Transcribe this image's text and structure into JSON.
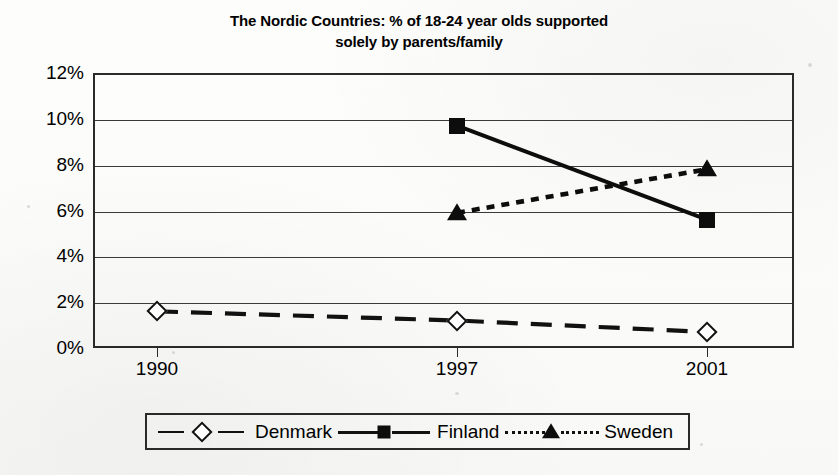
{
  "chart_data": {
    "type": "line",
    "title": "The Nordic Countries: % of 18-24 year olds supported\nsolely by parents/family",
    "subtitle": "",
    "xlabel": "",
    "ylabel": "",
    "categories": [
      "1990",
      "1997",
      "2001"
    ],
    "x_tick_labels": [
      "1990",
      "1997",
      "2001"
    ],
    "y_tick_labels": [
      "0%",
      "2%",
      "4%",
      "6%",
      "8%",
      "10%",
      "12%"
    ],
    "y_tick_values": [
      0,
      2,
      4,
      6,
      8,
      10,
      12
    ],
    "ylim": [
      0,
      12
    ],
    "y_unit": "%",
    "grid": true,
    "grid_axis": "y",
    "legend_position": "bottom",
    "series": [
      {
        "name": "Denmark",
        "marker": "open-diamond",
        "line_style": "long-dash",
        "color": "#111111",
        "values": [
          1.6,
          1.2,
          0.7
        ],
        "points": [
          {
            "x": "1990",
            "y": 1.6
          },
          {
            "x": "1997",
            "y": 1.2
          },
          {
            "x": "2001",
            "y": 0.7
          }
        ]
      },
      {
        "name": "Finland",
        "marker": "filled-square",
        "line_style": "solid",
        "color": "#0d0d0d",
        "values": [
          null,
          9.7,
          5.6
        ],
        "points": [
          {
            "x": "1997",
            "y": 9.7
          },
          {
            "x": "2001",
            "y": 5.6
          }
        ]
      },
      {
        "name": "Sweden",
        "marker": "filled-triangle",
        "line_style": "dotted",
        "color": "#0d0d0d",
        "values": [
          null,
          5.9,
          7.8
        ],
        "points": [
          {
            "x": "1997",
            "y": 5.9
          },
          {
            "x": "2001",
            "y": 7.8
          }
        ]
      }
    ]
  },
  "legend": {
    "entries": [
      {
        "label": "Denmark",
        "marker": "open-diamond"
      },
      {
        "label": "Finland",
        "marker": "filled-square"
      },
      {
        "label": "Sweden",
        "marker": "filled-triangle"
      }
    ]
  }
}
